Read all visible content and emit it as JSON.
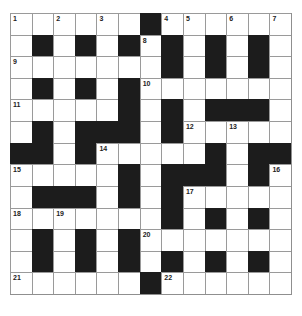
{
  "puzzle": {
    "type": "crossword",
    "rows": 13,
    "cols": 13,
    "layout": [
      "......#......",
      ".#.#.#.#.#.#.",
      ".......#.#.#.",
      ".#.#.#.......",
      ".....#.#.###.",
      ".#.###.#.....",
      "##.#.....#.##",
      ".....#.###.#.",
      ".###.#.#.....",
      ".......#.#.#.",
      ".#.#.#.......",
      ".#.#.#.#.#.#.",
      "......#......"
    ],
    "numbers": [
      {
        "n": "1",
        "r": 0,
        "c": 0
      },
      {
        "n": "2",
        "r": 0,
        "c": 2
      },
      {
        "n": "3",
        "r": 0,
        "c": 4
      },
      {
        "n": "4",
        "r": 0,
        "c": 7
      },
      {
        "n": "5",
        "r": 0,
        "c": 8
      },
      {
        "n": "6",
        "r": 0,
        "c": 10
      },
      {
        "n": "7",
        "r": 0,
        "c": 12
      },
      {
        "n": "8",
        "r": 1,
        "c": 6
      },
      {
        "n": "9",
        "r": 2,
        "c": 0
      },
      {
        "n": "10",
        "r": 3,
        "c": 6
      },
      {
        "n": "11",
        "r": 4,
        "c": 0
      },
      {
        "n": "12",
        "r": 5,
        "c": 8
      },
      {
        "n": "13",
        "r": 5,
        "c": 10
      },
      {
        "n": "14",
        "r": 6,
        "c": 4
      },
      {
        "n": "15",
        "r": 7,
        "c": 0
      },
      {
        "n": "16",
        "r": 7,
        "c": 12
      },
      {
        "n": "17",
        "r": 8,
        "c": 8
      },
      {
        "n": "18",
        "r": 9,
        "c": 0
      },
      {
        "n": "19",
        "r": 9,
        "c": 2
      },
      {
        "n": "20",
        "r": 10,
        "c": 6
      },
      {
        "n": "21",
        "r": 12,
        "c": 0
      },
      {
        "n": "22",
        "r": 12,
        "c": 7
      }
    ]
  },
  "colors": {
    "block": "#1c1c1c",
    "cell": "#ffffff",
    "gridline": "#9a9a9a"
  }
}
